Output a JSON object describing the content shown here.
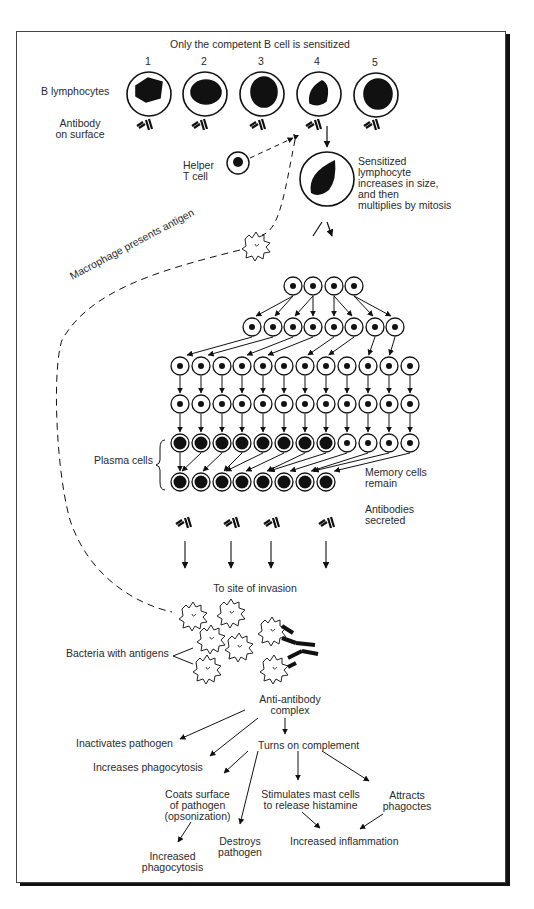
{
  "title": "Only the competent B cell is sensitized",
  "cell_numbers": [
    "1",
    "2",
    "3",
    "4",
    "5"
  ],
  "labels": {
    "b_lymphocytes": "B lymphocytes",
    "antibody_on_surface": "Antibody\non surface",
    "helper_t_cell": "Helper\nT cell",
    "sensitized": "Sensitized\nlymphocyte\nincreases in size,\nand then\nmultiplies by mitosis",
    "macrophage": "Macrophage presents antigen",
    "plasma_cells": "Plasma cells",
    "memory_cells": "Memory cells\nremain",
    "antibodies_secreted": "Antibodies\nsecreted",
    "site_of_invasion": "To site of invasion",
    "bacteria": "Bacteria with antigens",
    "anti_antibody": "Anti-antibody\ncomplex",
    "inactivates": "Inactivates pathogen",
    "increases_phago": "Increases phagocytosis",
    "complement": "Turns on complement",
    "coats": "Coats surface\nof pathogen\n(opsonization)",
    "destroys": "Destroys\npathogen",
    "mast": "Stimulates mast cells\nto release histamine",
    "attracts": "Attracts\nphagoctes",
    "inflammation": "Increased inflammation",
    "increased_phago2": "Increased\nphagocytosis"
  },
  "rows": {
    "row1": {
      "y": 277,
      "x": [
        313,
        334
      ]
    },
    "row2": {
      "y": 286,
      "x": [
        293,
        313,
        334,
        354
      ]
    },
    "row3": {
      "y": 327,
      "x": [
        252,
        273,
        293,
        313,
        334,
        354,
        375,
        395
      ]
    },
    "row4": {
      "y": 366,
      "x": [
        180,
        201,
        222,
        242,
        263,
        284,
        305,
        326,
        347,
        368,
        389,
        410
      ]
    },
    "row5": {
      "y": 404,
      "x": [
        180,
        201,
        222,
        242,
        263,
        284,
        305,
        326,
        347,
        368,
        389,
        410
      ]
    },
    "row6": {
      "y": 443,
      "x": [
        180,
        201,
        222,
        242,
        263,
        284,
        305,
        326,
        347,
        368,
        389,
        410
      ],
      "plasma_count": 8
    },
    "row7": {
      "y": 482,
      "x": [
        180,
        201,
        222,
        242,
        263,
        284,
        305,
        326
      ]
    }
  }
}
